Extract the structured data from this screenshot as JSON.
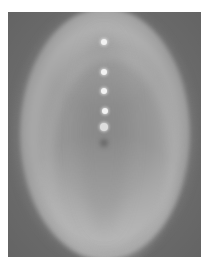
{
  "image": {
    "description": "Grayscale photograph of a glowing elliptical structure with a vertical row of bright dots",
    "background_color": "#6c6c6c",
    "ellipse_color": "#9a9a9a",
    "dot_color": "#f2f2f2",
    "dots": [
      {
        "x": 104,
        "y": 42,
        "size": "small"
      },
      {
        "x": 104,
        "y": 72,
        "size": "small"
      },
      {
        "x": 104,
        "y": 91,
        "size": "small"
      },
      {
        "x": 105,
        "y": 111,
        "size": "small"
      },
      {
        "x": 104,
        "y": 127,
        "size": "large"
      }
    ],
    "dark_spot": {
      "x": 104,
      "y": 143
    }
  }
}
